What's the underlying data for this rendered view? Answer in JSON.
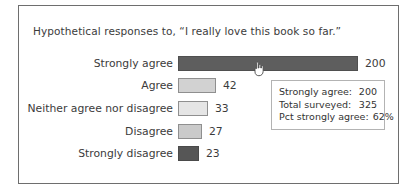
{
  "chart_data": {
    "type": "bar",
    "orientation": "horizontal",
    "title": "Hypothetical responses to, “I really love this book so far.”",
    "categories": [
      "Strongly agree",
      "Agree",
      "Neither agree nor disagree",
      "Disagree",
      "Strongly disagree"
    ],
    "values": [
      200,
      42,
      33,
      27,
      23
    ],
    "value_labels": [
      "200",
      "42",
      "33",
      "27",
      "23"
    ],
    "xlim": [
      0,
      200
    ],
    "grid": false,
    "legend": "none",
    "bar_styles": [
      {
        "fill": "#5e5e5e",
        "border": "#4f4f4f"
      },
      {
        "fill": "#d2d2d2",
        "border": "#8f8f8f"
      },
      {
        "fill": "#e5e5e5",
        "border": "#8f8f8f"
      },
      {
        "fill": "#cacaca",
        "border": "#8f8f8f"
      },
      {
        "fill": "#565656",
        "border": "#4a4a4a"
      }
    ]
  },
  "tooltip": {
    "rows": [
      {
        "label": "Strongly agree:",
        "value": "200"
      },
      {
        "label": "Total surveyed:",
        "value": "325"
      },
      {
        "label": "Pct strongly agree:",
        "value": "62%"
      }
    ]
  },
  "cursor": {
    "type": "hand-pointer",
    "hover_target": "Strongly agree bar"
  },
  "colors": {
    "panel_border": "#6e6e6e",
    "tooltip_border": "#b3b3b3",
    "text": "#3b3b3b",
    "background": "#ffffff"
  }
}
